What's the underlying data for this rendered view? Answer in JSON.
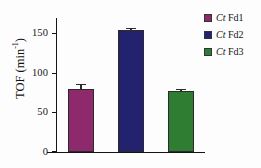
{
  "chart_data": {
    "type": "bar",
    "title": "",
    "xlabel": "",
    "ylabel": "TOF (min-1)",
    "ylabel_base": "TOF (min",
    "ylabel_exponent": "-1",
    "ylabel_close": ")",
    "ylim": [
      0,
      170
    ],
    "grid": false,
    "legend_position": "right",
    "categories": [
      "Ct Fd1",
      "Ct Fd2",
      "Ct Fd3"
    ],
    "values": [
      80,
      155,
      77
    ],
    "errors": [
      5,
      1.5,
      1.5
    ],
    "yticks": [
      0,
      50,
      100,
      150
    ],
    "ytick_labels": [
      "0",
      "50",
      "100",
      "150"
    ],
    "series": [
      {
        "name": "Ct Fd1",
        "genus": "Ct",
        "protein": "Fd1",
        "value": 80,
        "error": 5,
        "color": "#8E2A6B"
      },
      {
        "name": "Ct Fd2",
        "genus": "Ct",
        "protein": "Fd2",
        "value": 155,
        "error": 1.5,
        "color": "#23226E"
      },
      {
        "name": "Ct Fd3",
        "genus": "Ct",
        "protein": "Fd3",
        "value": 77,
        "error": 1.5,
        "color": "#2E7D32"
      }
    ]
  },
  "legend": {
    "items": [
      {
        "genus": "Ct",
        "label": "Fd1",
        "color": "#8E2A6B"
      },
      {
        "genus": "Ct",
        "label": "Fd2",
        "color": "#23226E"
      },
      {
        "genus": "Ct",
        "label": "Fd3",
        "color": "#2E7D32"
      }
    ]
  },
  "axis": {
    "y_title_base": "TOF (min",
    "y_title_sup": "-1",
    "y_title_end": ")",
    "tick_0": "0",
    "tick_50": "50",
    "tick_100": "100",
    "tick_150": "150"
  }
}
